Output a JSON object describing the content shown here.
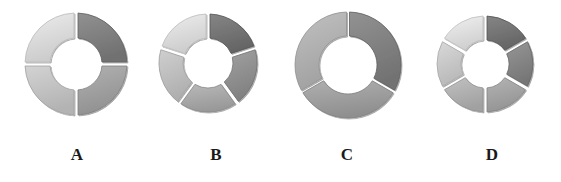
{
  "figure": {
    "background": "#ffffff",
    "label_color": "#1a1a1a"
  },
  "charts": [
    {
      "label": "A",
      "cx": 76,
      "cy": 64,
      "r_outer": 51,
      "r_inner": 26,
      "label_x": 77,
      "segments": 4,
      "gap_px": 4,
      "colors": [
        "#7b7b7b",
        "#9b9b9b",
        "#bdbdbd",
        "#d6d6d6"
      ]
    },
    {
      "label": "B",
      "cx": 208,
      "cy": 63,
      "r_outer": 49,
      "r_inner": 25,
      "label_x": 216,
      "segments": 5,
      "gap_px": 4,
      "colors": [
        "#6f6f6f",
        "#8b8b8b",
        "#a3a3a3",
        "#b9b9b9",
        "#d7d7d7"
      ]
    },
    {
      "label": "C",
      "cx": 348,
      "cy": 65,
      "r_outer": 53,
      "r_inner": 29,
      "label_x": 347,
      "segments": 3,
      "gap_px": 3,
      "colors": [
        "#7c7c7c",
        "#999999",
        "#ababab"
      ]
    },
    {
      "label": "D",
      "cx": 485,
      "cy": 64,
      "r_outer": 48,
      "r_inner": 24,
      "label_x": 492,
      "segments": 6,
      "gap_px": 4,
      "colors": [
        "#6f6f6f",
        "#808080",
        "#9e9e9e",
        "#ababab",
        "#c3c3c3",
        "#dadada"
      ]
    }
  ],
  "chart_data": [
    {
      "type": "pie",
      "title": "A",
      "categories": [
        "1",
        "2",
        "3",
        "4"
      ],
      "values": [
        25,
        25,
        25,
        25
      ],
      "donut": true
    },
    {
      "type": "pie",
      "title": "B",
      "categories": [
        "1",
        "2",
        "3",
        "4",
        "5"
      ],
      "values": [
        20,
        20,
        20,
        20,
        20
      ],
      "donut": true
    },
    {
      "type": "pie",
      "title": "C",
      "categories": [
        "1",
        "2",
        "3"
      ],
      "values": [
        33.3,
        33.3,
        33.3
      ],
      "donut": true
    },
    {
      "type": "pie",
      "title": "D",
      "categories": [
        "1",
        "2",
        "3",
        "4",
        "5",
        "6"
      ],
      "values": [
        16.7,
        16.7,
        16.7,
        16.7,
        16.7,
        16.7
      ],
      "donut": true
    }
  ]
}
